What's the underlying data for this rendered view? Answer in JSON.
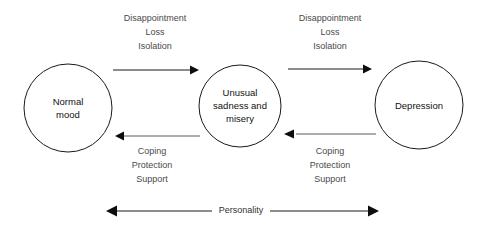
{
  "diagram": {
    "background_color": "#ffffff",
    "stroke_color": "#1a1a1a",
    "label_color": "#4a4a4a"
  },
  "nodes": [
    {
      "id": "normal-mood",
      "lines": [
        "Normal",
        "mood"
      ],
      "line1": "Normal",
      "line2": "mood",
      "cx": 68,
      "cy": 108,
      "r": 44
    },
    {
      "id": "unusual-sadness",
      "lines": [
        "Unusual",
        "sadness and",
        "misery"
      ],
      "line1": "Unusual",
      "line2": "sadness and",
      "line3": "misery",
      "cx": 240,
      "cy": 106,
      "r": 41
    },
    {
      "id": "depression",
      "lines": [
        "Depression"
      ],
      "line1": "Depression",
      "cx": 419,
      "cy": 105,
      "r": 44
    }
  ],
  "edges": [
    {
      "id": "normal-to-sadness",
      "direction": "right",
      "from": "normal-mood",
      "to": "unusual-sadness",
      "label_lines": [
        "Disappointment",
        "Loss",
        "Isolation"
      ],
      "label_line1": "Disappointment",
      "label_line2": "Loss",
      "label_line3": "Isolation"
    },
    {
      "id": "sadness-to-depression",
      "direction": "right",
      "from": "unusual-sadness",
      "to": "depression",
      "label_lines": [
        "Disappointment",
        "Loss",
        "Isolation"
      ],
      "label_line1": "Disappointment",
      "label_line2": "Loss",
      "label_line3": "Isolation"
    },
    {
      "id": "sadness-to-normal",
      "direction": "left",
      "from": "unusual-sadness",
      "to": "normal-mood",
      "label_lines": [
        "Coping",
        "Protection",
        "Support"
      ],
      "label_line1": "Coping",
      "label_line2": "Protection",
      "label_line3": "Support"
    },
    {
      "id": "depression-to-sadness",
      "direction": "left",
      "from": "depression",
      "to": "unusual-sadness",
      "label_lines": [
        "Coping",
        "Protection",
        "Support"
      ],
      "label_line1": "Coping",
      "label_line2": "Protection",
      "label_line3": "Support"
    }
  ],
  "axis": {
    "id": "personality-axis",
    "label": "Personality",
    "direction": "bidirectional",
    "x_start": 107,
    "x_end": 378,
    "y": 211
  }
}
